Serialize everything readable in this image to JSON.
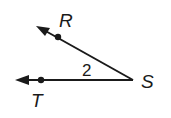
{
  "diagram": {
    "type": "angle",
    "vertex": {
      "label": "S",
      "x": 133,
      "y": 80
    },
    "rays": [
      {
        "name": "ray-SR",
        "point_label": "R",
        "point": {
          "x": 58,
          "y": 36
        },
        "arrow_tip": {
          "x": 37,
          "y": 26
        }
      },
      {
        "name": "ray-ST",
        "point_label": "T",
        "point": {
          "x": 41,
          "y": 80
        },
        "arrow_tip": {
          "x": 16,
          "y": 80
        }
      }
    ],
    "angle_label": "2",
    "labels": {
      "R": "R",
      "S": "S",
      "T": "T",
      "angle": "2"
    },
    "stroke_color": "#1a1a1a"
  }
}
